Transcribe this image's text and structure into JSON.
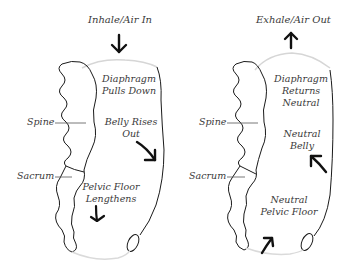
{
  "diagram": {
    "panels": [
      {
        "id": "inhale",
        "title": "Inhale/Air In",
        "title_arrow": "down",
        "labels": {
          "diaphragm_line1": "Diaphragm",
          "diaphragm_line2": "Pulls Down",
          "belly_line1": "Belly Rises",
          "belly_line2": "Out",
          "pelvic_line1": "Pelvic Floor",
          "pelvic_line2": "Lengthens",
          "spine": "Spine",
          "sacrum": "Sacrum"
        }
      },
      {
        "id": "exhale",
        "title": "Exhale/Air Out",
        "title_arrow": "up",
        "labels": {
          "diaphragm_line1": "Diaphragm",
          "diaphragm_line2": "Returns",
          "diaphragm_line3": "Neutral",
          "belly_line1": "Neutral",
          "belly_line2": "Belly",
          "pelvic_line1": "Neutral",
          "pelvic_line2": "Pelvic Floor",
          "spine": "Spine",
          "sacrum": "Sacrum"
        }
      }
    ],
    "colors": {
      "stroke": "#1a1a1a",
      "faint": "#d8d8d8",
      "text": "#3a3a3a",
      "background": "#ffffff"
    }
  }
}
